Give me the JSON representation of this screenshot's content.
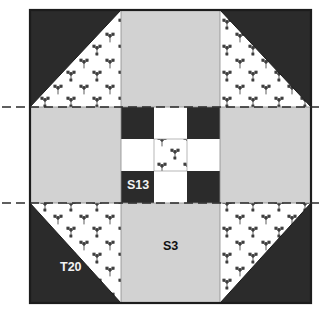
{
  "diagram": {
    "kind": "quilt-block-piecing-diagram",
    "block": {
      "x": 30,
      "y": 10,
      "width": 281,
      "height": 293,
      "grid_columns": 3,
      "grid_rows": 3,
      "outline_color": "#1c1c1c"
    },
    "colors": {
      "dark": "#2b2b2b",
      "gray": "#d2d2d2",
      "print_background": "#ffffff",
      "print_motif": "#3a3a3a",
      "outline": "#1c1c1c",
      "seam_line": "#8a8a8a",
      "guide_line": "#2b2b2b",
      "page_background": "#ffffff"
    },
    "labels": [
      {
        "id": "label-t20",
        "text": "T20",
        "x": 60,
        "y": 271,
        "style": "light",
        "patch": "corner-triangle-dark"
      },
      {
        "id": "label-s3",
        "text": "S3",
        "x": 163,
        "y": 250,
        "style": "dark",
        "patch": "edge-square-gray"
      },
      {
        "id": "label-s13",
        "text": "S13",
        "x": 139,
        "y": 189,
        "style": "light",
        "patch": "ninepatch-square-dark"
      }
    ],
    "guide_lines": [
      {
        "id": "guide-top",
        "orientation": "horizontal",
        "y": 107,
        "x_start": 2,
        "x_end": 323,
        "dash": "9 5",
        "style": "dash-dot"
      },
      {
        "id": "guide-bottom",
        "orientation": "horizontal",
        "y": 203,
        "x_start": 2,
        "x_end": 323,
        "dash": "9 5",
        "style": "dash-dot"
      }
    ],
    "units": [
      {
        "id": "corner-top-left",
        "row": 0,
        "col": 0,
        "type": "half-square-triangle",
        "dark_corner": "top-left",
        "fabrics": [
          "dark",
          "print"
        ]
      },
      {
        "id": "edge-top-center",
        "row": 0,
        "col": 1,
        "type": "plain-square",
        "fabrics": [
          "gray"
        ]
      },
      {
        "id": "corner-top-right",
        "row": 0,
        "col": 2,
        "type": "half-square-triangle",
        "dark_corner": "top-right",
        "fabrics": [
          "dark",
          "print"
        ]
      },
      {
        "id": "edge-middle-left",
        "row": 1,
        "col": 0,
        "type": "plain-square",
        "fabrics": [
          "gray"
        ]
      },
      {
        "id": "center-nine-patch",
        "row": 1,
        "col": 1,
        "type": "nine-patch",
        "fabrics": [
          "dark",
          "print",
          "white"
        ]
      },
      {
        "id": "edge-middle-right",
        "row": 1,
        "col": 2,
        "type": "plain-square",
        "fabrics": [
          "gray"
        ]
      },
      {
        "id": "corner-bottom-left",
        "row": 2,
        "col": 0,
        "type": "half-square-triangle",
        "dark_corner": "bottom-left",
        "fabrics": [
          "dark",
          "print"
        ]
      },
      {
        "id": "edge-bottom-center",
        "row": 2,
        "col": 1,
        "type": "plain-square",
        "fabrics": [
          "gray"
        ]
      },
      {
        "id": "corner-bottom-right",
        "row": 2,
        "col": 2,
        "type": "half-square-triangle",
        "dark_corner": "bottom-right",
        "fabrics": [
          "dark",
          "print"
        ]
      }
    ],
    "nine_patch": {
      "id": "center-nine-patch",
      "x": 121,
      "y": 107,
      "width": 99,
      "height": 96,
      "cells": [
        {
          "row": 0,
          "col": 0,
          "fabric": "dark",
          "id": "np-r0c0"
        },
        {
          "row": 0,
          "col": 1,
          "fabric": "white",
          "id": "np-r0c1"
        },
        {
          "row": 0,
          "col": 2,
          "fabric": "dark",
          "id": "np-r0c2"
        },
        {
          "row": 1,
          "col": 0,
          "fabric": "white",
          "id": "np-r1c0"
        },
        {
          "row": 1,
          "col": 1,
          "fabric": "print",
          "id": "np-r1c1"
        },
        {
          "row": 1,
          "col": 2,
          "fabric": "white",
          "id": "np-r1c2"
        },
        {
          "row": 2,
          "col": 0,
          "fabric": "dark",
          "id": "np-r2c0"
        },
        {
          "row": 2,
          "col": 1,
          "fabric": "white",
          "id": "np-r2c1"
        },
        {
          "row": 2,
          "col": 2,
          "fabric": "dark",
          "id": "np-r2c2"
        }
      ]
    }
  }
}
